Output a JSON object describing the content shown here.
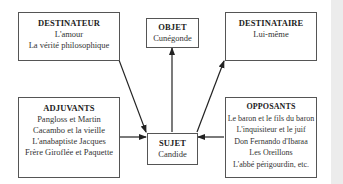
{
  "diagram": {
    "type": "actantial-model",
    "nodes": {
      "destinateur": {
        "title": "DESTINATEUR",
        "lines": [
          "L'amour",
          "La vérité philosophique"
        ]
      },
      "objet": {
        "title": "OBJET",
        "lines": [
          "Cunégonde"
        ]
      },
      "destinataire": {
        "title": "DESTINATAIRE",
        "lines": [
          "Lui-même"
        ]
      },
      "adjuvants": {
        "title": "ADJUVANTS",
        "lines": [
          "Pangloss et Martin",
          "Cacambo et la vieille",
          "L'anabaptiste Jacques",
          "Frère Giroflée et Paquette"
        ]
      },
      "sujet": {
        "title": "SUJET",
        "lines": [
          "Candide"
        ]
      },
      "opposants": {
        "title": "OPPOSANTS",
        "lines": [
          "Le baron et le fils du baron",
          "L'inquisiteur et le juif",
          "Don Fernando d'Ibaraa",
          "Les Oreillons",
          "L'abbé périgourdin, etc."
        ]
      }
    },
    "edges": [
      {
        "from": "destinateur",
        "to": "sujet"
      },
      {
        "from": "sujet",
        "to": "objet"
      },
      {
        "from": "sujet",
        "to": "destinataire"
      },
      {
        "from": "adjuvants",
        "to": "sujet"
      },
      {
        "from": "opposants",
        "to": "sujet"
      }
    ]
  }
}
